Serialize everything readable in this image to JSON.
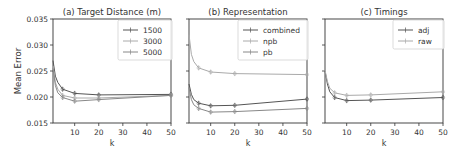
{
  "figure": {
    "ylabel": "Mean Error",
    "xlabel": "k"
  },
  "chart_data": [
    {
      "type": "line",
      "title": "(a) Target Distance (m)",
      "xlabel": "k",
      "ylabel": "Mean Error",
      "xlim": [
        1,
        50
      ],
      "ylim": [
        0.015,
        0.035
      ],
      "xticks": [
        10,
        20,
        30,
        40,
        50
      ],
      "yticks": [
        0.015,
        0.02,
        0.025,
        0.03,
        0.035
      ],
      "ytick_labels": [
        "0.015",
        "0.020",
        "0.025",
        "0.030",
        "0.035"
      ],
      "legend_position": "upper right",
      "x": [
        1,
        2,
        3,
        5,
        10,
        20,
        50
      ],
      "series": [
        {
          "name": "1500",
          "color": "#555555",
          "values": [
            0.027,
            0.024,
            0.0228,
            0.0215,
            0.0207,
            0.0204,
            0.0205
          ]
        },
        {
          "name": "3000",
          "color": "#aaaaaa",
          "values": [
            0.026,
            0.0228,
            0.0215,
            0.0203,
            0.0198,
            0.0198,
            0.0203
          ]
        },
        {
          "name": "5000",
          "color": "#888888",
          "values": [
            0.0255,
            0.0222,
            0.0208,
            0.0199,
            0.0192,
            0.0195,
            0.0203
          ]
        }
      ]
    },
    {
      "type": "line",
      "title": "(b) Representation",
      "xlabel": "k",
      "ylabel": "",
      "xlim": [
        1,
        50
      ],
      "ylim": [
        0.015,
        0.035
      ],
      "xticks": [
        10,
        20,
        30,
        40,
        50
      ],
      "yticks": [
        0.015,
        0.02,
        0.025,
        0.03,
        0.035
      ],
      "legend_position": "upper right",
      "x": [
        1,
        2,
        3,
        5,
        10,
        20,
        50
      ],
      "series": [
        {
          "name": "combined",
          "color": "#555555",
          "values": [
            0.0225,
            0.0205,
            0.0195,
            0.0188,
            0.0183,
            0.0184,
            0.0196
          ]
        },
        {
          "name": "npb",
          "color": "#aaaaaa",
          "values": [
            0.032,
            0.0282,
            0.0268,
            0.0256,
            0.0248,
            0.0245,
            0.0243
          ]
        },
        {
          "name": "pb",
          "color": "#888888",
          "values": [
            0.0218,
            0.0195,
            0.0185,
            0.0178,
            0.0171,
            0.0172,
            0.0178
          ]
        }
      ]
    },
    {
      "type": "line",
      "title": "(c) Timings",
      "xlabel": "k",
      "ylabel": "",
      "xlim": [
        1,
        50
      ],
      "ylim": [
        0.015,
        0.035
      ],
      "xticks": [
        10,
        20,
        30,
        40,
        50
      ],
      "yticks": [
        0.015,
        0.02,
        0.025,
        0.03,
        0.035
      ],
      "legend_position": "upper right",
      "x": [
        1,
        2,
        3,
        5,
        10,
        20,
        50
      ],
      "series": [
        {
          "name": "adj",
          "color": "#555555",
          "values": [
            0.025,
            0.0225,
            0.021,
            0.0199,
            0.0193,
            0.0194,
            0.0199
          ]
        },
        {
          "name": "raw",
          "color": "#aaaaaa",
          "values": [
            0.0252,
            0.023,
            0.0217,
            0.0208,
            0.0203,
            0.0204,
            0.021
          ]
        }
      ]
    }
  ]
}
